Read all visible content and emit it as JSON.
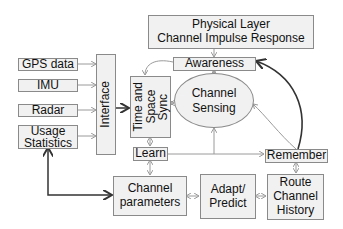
{
  "diagram": {
    "nodes": {
      "physical_layer": {
        "line1": "Physical Layer",
        "line2": "Channel Impulse Response"
      },
      "awareness": "Awareness",
      "channel_sensing": {
        "line1": "Channel",
        "line2": "Sensing"
      },
      "time_space_sync": {
        "line1": "Time and",
        "line2": "Space",
        "line3": "Sync"
      },
      "interface": "Interface",
      "gps": "GPS data",
      "imu": "IMU",
      "radar": "Radar",
      "usage_statistics": {
        "line1": "Usage",
        "line2": "Statistics"
      },
      "learn": "Learn",
      "remember": "Remember",
      "channel_parameters": {
        "line1": "Channel",
        "line2": "parameters"
      },
      "adapt_predict": {
        "line1": "Adapt/",
        "line2": "Predict"
      },
      "route_channel_history": {
        "line1": "Route",
        "line2": "Channel",
        "line3": "History"
      }
    },
    "edges": [
      {
        "from": "GPS data",
        "to": "Interface"
      },
      {
        "from": "IMU",
        "to": "Interface"
      },
      {
        "from": "Radar",
        "to": "Interface"
      },
      {
        "from": "Usage Statistics",
        "to": "Interface"
      },
      {
        "from": "Interface",
        "to": "Time and Space Sync"
      },
      {
        "from": "Physical Layer",
        "to": "Awareness"
      },
      {
        "from": "Awareness",
        "to": "Time and Space Sync"
      },
      {
        "from": "Awareness",
        "to": "Channel Sensing",
        "bidirectional": true
      },
      {
        "from": "Time and Space Sync",
        "to": "Channel Sensing",
        "bidirectional": true
      },
      {
        "from": "Time and Space Sync",
        "to": "Learn",
        "bidirectional": true
      },
      {
        "from": "Learn",
        "to": "Channel Sensing"
      },
      {
        "from": "Learn",
        "to": "Remember"
      },
      {
        "from": "Remember",
        "to": "Channel Sensing"
      },
      {
        "from": "Remember",
        "to": "Awareness",
        "style": "thick-curve"
      },
      {
        "from": "Learn",
        "to": "Channel parameters",
        "bidirectional": true
      },
      {
        "from": "Channel parameters",
        "to": "Adapt/Predict",
        "bidirectional": true
      },
      {
        "from": "Adapt/Predict",
        "to": "Route Channel History",
        "bidirectional": true
      },
      {
        "from": "Remember",
        "to": "Route Channel History",
        "bidirectional": true
      },
      {
        "from": "Channel parameters",
        "to": "Usage Statistics",
        "bidirectional": true,
        "style": "thick"
      }
    ],
    "colors": {
      "box_fill": "#f1f1f1",
      "box_border": "#8a8a8a",
      "thin_arrow": "#9a9a9a",
      "thick_arrow": "#333333"
    }
  }
}
